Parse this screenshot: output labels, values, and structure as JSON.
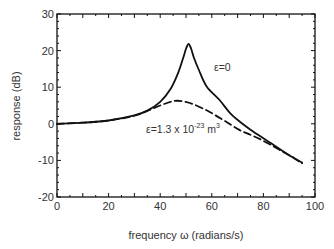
{
  "chart_data": {
    "type": "line",
    "title": "",
    "xlabel": "frequency ω (radians/s)",
    "ylabel": "response (dB)",
    "xlim": [
      0,
      100
    ],
    "ylim": [
      -20,
      30
    ],
    "xticks": [
      0,
      20,
      40,
      60,
      80,
      100
    ],
    "yticks": [
      -20,
      -10,
      0,
      10,
      20,
      30
    ],
    "grid": false,
    "legend": "none (inline annotations)",
    "series": [
      {
        "name": "ε=0",
        "style": "solid",
        "color": "#111111",
        "x": [
          0,
          10,
          20,
          30,
          35,
          40,
          44,
          47,
          49,
          50,
          51,
          52,
          53,
          55,
          58,
          63,
          67,
          71,
          75,
          79,
          83,
          87,
          91,
          95
        ],
        "y": [
          0,
          0.3,
          0.9,
          2.3,
          3.6,
          6.0,
          9.5,
          14.0,
          18.2,
          20.5,
          21.8,
          20.5,
          18.2,
          14.7,
          10.2,
          6.5,
          3.0,
          0.5,
          -1.6,
          -3.5,
          -5.3,
          -7.2,
          -9.0,
          -10.6
        ]
      },
      {
        "name": "ε=1.3 x 10^-23 m^3",
        "style": "dashed",
        "color": "#111111",
        "x": [
          0,
          10,
          20,
          30,
          36,
          40,
          44,
          46.5,
          49,
          53,
          59,
          65,
          70.5,
          75,
          79,
          83,
          87,
          91,
          95
        ],
        "y": [
          0,
          0.3,
          0.9,
          2.2,
          3.8,
          5.0,
          6.0,
          6.3,
          6.1,
          5.3,
          3.3,
          0.8,
          -1.6,
          -3.0,
          -4.3,
          -5.8,
          -7.4,
          -9.0,
          -10.8
        ]
      }
    ],
    "annotations": [
      {
        "text": "ε=0",
        "x": 61,
        "y": 16.5
      },
      {
        "text": "ε=1.3 x 10",
        "sup1": "-23",
        "unit": " m",
        "sup2": "3",
        "x": 35,
        "y": -1.5
      }
    ]
  },
  "labels": {
    "x_axis": "frequency ω (radians/s)",
    "y_axis": "response (dB)",
    "annot_eps0": "ε=0",
    "annot_eps1_base": "ε=1.3 x 10",
    "annot_eps1_exp": "-23",
    "annot_eps1_unit": " m",
    "annot_eps1_unit_exp": "3"
  }
}
